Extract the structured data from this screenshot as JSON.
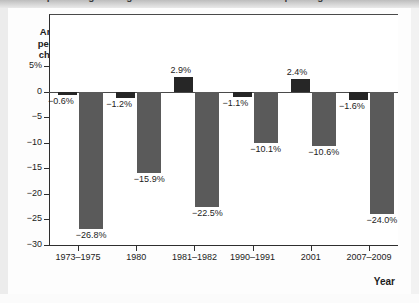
{
  "title_strip": {
    "clipped_text": "Annual percentage change in consumer and investment spending"
  },
  "axis": {
    "y_title_lines": [
      "Annual",
      "percent",
      "change"
    ],
    "x_title": "Year"
  },
  "legend": {
    "items": [
      {
        "label": "Consumer spending",
        "color": "#262626",
        "key": "consumer"
      },
      {
        "label": "Investment spending",
        "color": "#5a5a5a",
        "key": "invest"
      }
    ]
  },
  "chart_data": {
    "type": "bar",
    "title": "Annual percentage change in consumer and investment spending",
    "xlabel": "Year",
    "ylabel": "Annual percent change",
    "ylim": [
      -30,
      5
    ],
    "yticks": [
      5,
      0,
      -5,
      -10,
      -15,
      -20,
      -25,
      -30
    ],
    "ytick_labels": [
      "5%",
      "0",
      "-5",
      "-10",
      "-15",
      "-20",
      "-25",
      "-30"
    ],
    "grid": false,
    "legend_position": "top-center",
    "categories": [
      "1973-1975",
      "1980",
      "1981-1982",
      "1990-1991",
      "2001",
      "2007-2009"
    ],
    "series": [
      {
        "name": "Consumer spending",
        "color": "#262626",
        "values": [
          -0.6,
          -1.2,
          2.9,
          -1.1,
          2.4,
          -1.6
        ],
        "labels": [
          "-0.6%",
          "-1.2%",
          "2.9%",
          "-1.1%",
          "2.4%",
          "-1.6%"
        ]
      },
      {
        "name": "Investment spending",
        "color": "#5a5a5a",
        "values": [
          -26.8,
          -15.9,
          -22.5,
          -10.1,
          -10.6,
          -24.0
        ],
        "labels": [
          "-26.8%",
          "-15.9%",
          "-22.5%",
          "-10.1%",
          "-10.6%",
          "-24.0%"
        ]
      }
    ]
  }
}
